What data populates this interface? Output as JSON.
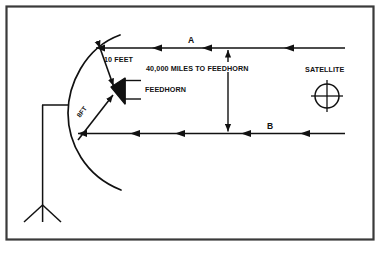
{
  "figure": {
    "border_color": "#3a3a3a",
    "ink_color": "#111111",
    "background": "#ffffff"
  },
  "labels": {
    "ten_feet": "10 FEET",
    "eight_ft": "8FT",
    "feedhorn": "FEEDHORN",
    "distance_to_feedhorn": "40,000 MILES TO FEEDHORN",
    "satellite": "SATELLITE",
    "ray_a": "A",
    "ray_b": "B"
  },
  "components": {
    "dish": "parabolic-reflector",
    "feedhorn": "feedhorn-cone",
    "mount": "tripod-mount",
    "satellite": "satellite-crosshair-symbol",
    "ray_upper": "incoming-signal-ray-a",
    "ray_lower": "incoming-signal-ray-b",
    "dimension_vertical": "vertical-dimension-arrow"
  }
}
